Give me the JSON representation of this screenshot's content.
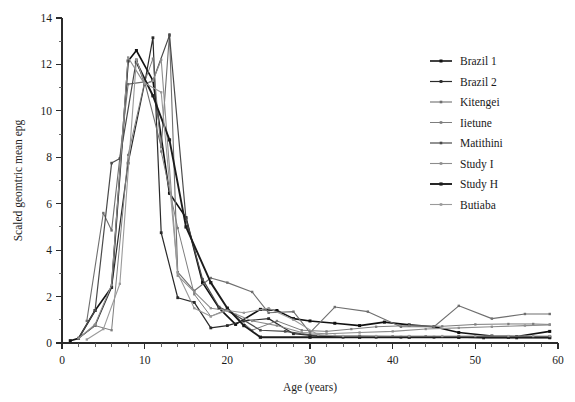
{
  "chart_data": {
    "type": "line",
    "title": "",
    "xlabel": "Age (years)",
    "ylabel": "Scaled geomtric mean epg",
    "xlim": [
      0,
      60
    ],
    "ylim": [
      0,
      14
    ],
    "xticks": [
      0,
      10,
      20,
      30,
      40,
      50,
      60
    ],
    "yticks": [
      0,
      2,
      4,
      6,
      8,
      10,
      12,
      14
    ],
    "x_minor_step": 2,
    "y_minor_step": 1,
    "grid": false,
    "legend_position": "right",
    "series": [
      {
        "name": "Brazil 1",
        "color": "#111111",
        "width": 1.6,
        "marker": "square",
        "marker_size": 3.0,
        "x": [
          1,
          2,
          4,
          6,
          8,
          9,
          11,
          13,
          15,
          17,
          19,
          21,
          24,
          26,
          28,
          30,
          33,
          36,
          39,
          42,
          45,
          48,
          52,
          55,
          59
        ],
        "y": [
          0.1,
          0.2,
          1.4,
          2.4,
          12.15,
          12.6,
          11.3,
          6.45,
          5.4,
          2.6,
          1.5,
          0.8,
          1.45,
          1.4,
          1.05,
          0.95,
          0.85,
          0.75,
          0.9,
          0.78,
          0.7,
          0.45,
          0.3,
          0.28,
          0.5
        ]
      },
      {
        "name": "Brazil 2",
        "color": "#2a2a2a",
        "width": 1.2,
        "marker": "square",
        "marker_size": 2.8,
        "x": [
          2,
          4,
          6,
          8,
          10,
          11,
          12,
          14,
          16,
          18,
          20,
          22,
          25,
          28,
          31,
          34,
          38,
          41,
          45,
          48,
          51,
          55,
          59
        ],
        "y": [
          0.2,
          0.75,
          2.4,
          7.75,
          11.2,
          13.15,
          4.75,
          1.95,
          1.75,
          0.65,
          0.75,
          0.95,
          1.05,
          0.4,
          0.3,
          0.25,
          0.25,
          0.25,
          0.25,
          0.25,
          0.22,
          0.22,
          0.22
        ]
      },
      {
        "name": "Kitengei",
        "color": "#6f6f6f",
        "width": 1.1,
        "marker": "square",
        "marker_size": 2.4,
        "x": [
          3,
          5,
          6,
          8,
          10,
          12,
          13,
          14,
          16,
          18,
          20,
          23,
          25,
          28,
          30,
          33,
          37,
          41,
          45,
          48,
          52,
          56,
          59
        ],
        "y": [
          0.95,
          5.6,
          4.85,
          11.15,
          11.25,
          8.45,
          13.3,
          3.05,
          2.25,
          2.8,
          2.6,
          2.2,
          1.3,
          1.35,
          0.45,
          1.55,
          1.35,
          0.7,
          0.7,
          1.6,
          1.05,
          1.25,
          1.25
        ]
      },
      {
        "name": "Iietune",
        "color": "#7d7d7d",
        "width": 1.0,
        "marker": "square",
        "marker_size": 2.3,
        "x": [
          2,
          4,
          6,
          8,
          10,
          11,
          12,
          14,
          16,
          18,
          20,
          23,
          26,
          29,
          32,
          35,
          38,
          42,
          46,
          50,
          54,
          57,
          59
        ],
        "y": [
          0.2,
          0.75,
          0.55,
          8.1,
          11.25,
          12.25,
          8.25,
          4.95,
          2.1,
          1.15,
          1.45,
          0.55,
          0.95,
          0.55,
          0.5,
          0.6,
          0.7,
          0.75,
          0.72,
          0.8,
          0.82,
          0.82,
          0.8
        ]
      },
      {
        "name": "Matithini",
        "color": "#4a4a4a",
        "width": 1.2,
        "marker": "square",
        "marker_size": 2.6,
        "x": [
          2,
          4,
          6,
          7,
          9,
          10,
          11,
          13,
          15,
          17,
          19,
          21,
          24,
          27,
          30,
          33,
          36,
          40,
          44,
          48,
          52,
          56,
          59
        ],
        "y": [
          0.2,
          1.4,
          7.75,
          7.95,
          12.2,
          11.15,
          11.3,
          13.25,
          5.35,
          2.75,
          1.55,
          1.2,
          0.55,
          0.5,
          0.35,
          0.3,
          0.3,
          0.28,
          0.28,
          0.28,
          0.28,
          0.28,
          0.28
        ]
      },
      {
        "name": "Study I",
        "color": "#8d8d8d",
        "width": 1.1,
        "marker": "square",
        "marker_size": 2.3,
        "x": [
          2,
          4,
          6,
          8,
          10,
          11,
          12,
          14,
          16,
          18,
          20,
          23,
          26,
          29,
          32,
          36,
          40,
          44,
          48,
          52,
          56,
          59
        ],
        "y": [
          0.2,
          0.8,
          2.5,
          12.3,
          11.15,
          11.3,
          12.2,
          2.9,
          2.2,
          1.5,
          1.4,
          0.95,
          0.75,
          0.45,
          0.4,
          0.45,
          0.5,
          0.6,
          0.65,
          0.7,
          0.75,
          0.78
        ]
      },
      {
        "name": "Study H",
        "color": "#1c1c1c",
        "width": 1.9,
        "marker": "square",
        "marker_size": 3.2,
        "x": [
          9,
          11,
          13,
          15,
          18,
          20,
          22,
          24,
          30,
          36,
          42,
          48,
          54,
          59
        ],
        "y": [
          12.1,
          10.65,
          8.75,
          5.0,
          2.6,
          1.5,
          0.75,
          0.25,
          0.25,
          0.25,
          0.25,
          0.25,
          0.25,
          0.25
        ]
      },
      {
        "name": "Butiaba",
        "color": "#9a9a9a",
        "width": 1.1,
        "marker": "square",
        "marker_size": 2.3,
        "x": [
          3,
          5,
          7,
          9,
          10,
          12,
          14,
          16,
          18,
          20,
          22,
          25,
          28,
          31,
          34,
          38,
          42,
          46,
          50,
          54,
          57,
          59
        ],
        "y": [
          0.15,
          0.6,
          2.55,
          12.2,
          11.2,
          10.8,
          3.0,
          1.5,
          1.15,
          1.4,
          1.3,
          1.5,
          1.0,
          0.35,
          0.3,
          0.3,
          0.3,
          0.3,
          0.3,
          0.3,
          0.3,
          0.3
        ]
      }
    ]
  },
  "legend": {
    "items": [
      {
        "label": "Brazil 1"
      },
      {
        "label": "Brazil 2"
      },
      {
        "label": "Kitengei"
      },
      {
        "label": "Iietune"
      },
      {
        "label": "Matithini"
      },
      {
        "label": "Study I"
      },
      {
        "label": "Study H"
      },
      {
        "label": "Butiaba"
      }
    ]
  },
  "axes": {
    "x_title": "Age (years)",
    "y_title": "Scaled geomtric mean epg",
    "x_tick_labels": [
      "0",
      "10",
      "20",
      "30",
      "40",
      "50",
      "60"
    ],
    "y_tick_labels": [
      "0",
      "2",
      "4",
      "6",
      "8",
      "10",
      "12",
      "14"
    ]
  }
}
